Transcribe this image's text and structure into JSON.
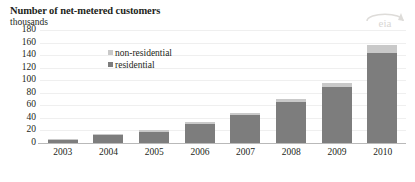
{
  "chart_data": {
    "type": "bar",
    "title": "Number of net-metered customers",
    "subtitle": "thousands",
    "xlabel": "",
    "ylabel": "thousands",
    "ylim": [
      0,
      180
    ],
    "ytick_step": 20,
    "grid": true,
    "stacked": true,
    "legend_position": "inside-upper-left",
    "categories": [
      "2003",
      "2004",
      "2005",
      "2006",
      "2007",
      "2008",
      "2009",
      "2010"
    ],
    "series": [
      {
        "name": "residential",
        "color": "#7d7d7d",
        "values": [
          5,
          13,
          18,
          31,
          45,
          65,
          89,
          143
        ]
      },
      {
        "name": "non-residential",
        "color": "#c9c9c9",
        "values": [
          1,
          2,
          2,
          3,
          3,
          5,
          7,
          13
        ]
      }
    ],
    "totals": [
      6,
      15,
      20,
      34,
      48,
      70,
      96,
      156
    ],
    "ytick_labels": [
      "180",
      "160",
      "140",
      "120",
      "100",
      "80",
      "60",
      "40",
      "20",
      "0"
    ],
    "annotations": []
  },
  "header": {
    "title": "Number of net-metered customers",
    "subtitle": "thousands"
  },
  "legend": {
    "items": [
      {
        "label": "non-residential",
        "color": "#c9c9c9"
      },
      {
        "label": "residential",
        "color": "#7d7d7d"
      }
    ]
  },
  "logo": {
    "name": "eia-logo",
    "text": "eia"
  },
  "colors": {
    "residential": "#7d7d7d",
    "non_residential": "#c9c9c9",
    "gridline": "#efefef",
    "axis": "#b9b9b9",
    "text": "#231f20"
  }
}
